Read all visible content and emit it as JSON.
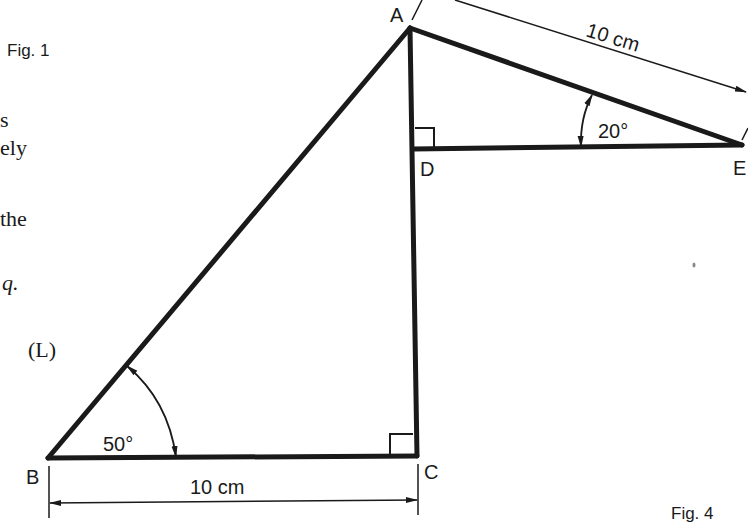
{
  "margin_text": {
    "fig1": "Fig. 1",
    "fragments": [
      "s",
      "ely",
      "the",
      "q."
    ],
    "label_L": "(L)"
  },
  "figure": {
    "caption": "Fig. 4",
    "points": {
      "A": "A",
      "B": "B",
      "C": "C",
      "D": "D",
      "E": "E"
    },
    "angles": {
      "B": "50°",
      "E": "20°"
    },
    "lengths": {
      "BC": "10 cm",
      "AE": "10 cm"
    },
    "right_angles": [
      "C",
      "D"
    ]
  }
}
